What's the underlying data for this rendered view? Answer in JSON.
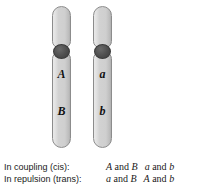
{
  "figure": {
    "type": "genetics-linkage-diagram",
    "background_color": "#ffffff",
    "chromosomes": [
      {
        "id": "chromosome-left",
        "label": "left homolog",
        "fill_color": "#d2d2d2",
        "outline_color": "#8c8c8c",
        "centromere_color": "#4e4e4e",
        "short_arm_label": "",
        "alleles": [
          {
            "symbol": "A",
            "arm": "long",
            "position": "upper"
          },
          {
            "symbol": "B",
            "arm": "long",
            "position": "lower"
          }
        ]
      },
      {
        "id": "chromosome-right",
        "label": "right homolog",
        "fill_color": "#d2d2d2",
        "outline_color": "#8c8c8c",
        "centromere_color": "#4e4e4e",
        "short_arm_label": "",
        "alleles": [
          {
            "symbol": "a",
            "arm": "long",
            "position": "upper"
          },
          {
            "symbol": "b",
            "arm": "long",
            "position": "lower"
          }
        ]
      }
    ]
  },
  "caption": {
    "rows": [
      {
        "label": "In coupling (cis):",
        "pairs": [
          {
            "left": "A",
            "conj": "and",
            "right": "B"
          },
          {
            "left": "a",
            "conj": "and",
            "right": "b"
          }
        ]
      },
      {
        "label": "In repulsion (trans):",
        "pairs": [
          {
            "left": "a",
            "conj": "and",
            "right": "B"
          },
          {
            "left": "A",
            "conj": "and",
            "right": "b"
          }
        ]
      }
    ]
  }
}
